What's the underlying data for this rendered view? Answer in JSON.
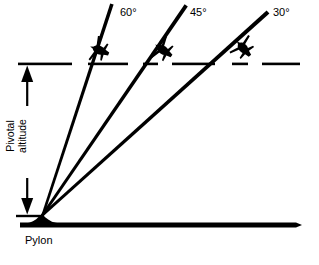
{
  "figure": {
    "type": "diagram",
    "background_color": "#ffffff",
    "ink_color": "#000000"
  },
  "labels": {
    "angle_60": "60°",
    "angle_45": "45°",
    "angle_30": "30°",
    "pylon": "Pylon",
    "pivotal_line_1": "Pivotal",
    "pivotal_line_2": "altitude"
  },
  "diagram_data": {
    "pylon_apex": {
      "x": 42,
      "y": 216
    },
    "ground_line": {
      "x1": 20,
      "y1": 225,
      "x2": 300,
      "y2": 225,
      "width": 4
    },
    "pivotal_altitude_line": {
      "y": 64,
      "x_start": 18,
      "x_end": 300,
      "style": "dashed",
      "segments": [
        {
          "x1": 18,
          "x2": 72
        },
        {
          "x1": 88,
          "x2": 128
        },
        {
          "x1": 143,
          "x2": 158
        },
        {
          "x1": 172,
          "x2": 215
        },
        {
          "x1": 232,
          "x2": 248
        },
        {
          "x1": 262,
          "x2": 300
        }
      ]
    },
    "sight_lines": [
      {
        "angle_label": "60°",
        "angle_deg": 60,
        "x1": 42,
        "y1": 216,
        "x2": 112,
        "y2": 4
      },
      {
        "angle_label": "45°",
        "angle_deg": 45,
        "x1": 42,
        "y1": 216,
        "x2": 186,
        "y2": 6
      },
      {
        "angle_label": "30°",
        "angle_deg": 30,
        "x1": 42,
        "y1": 216,
        "x2": 268,
        "y2": 12
      }
    ],
    "aircraft": [
      {
        "angle_label": "60°",
        "x": 99,
        "y": 50,
        "rotation_deg": -68
      },
      {
        "angle_label": "45°",
        "x": 163,
        "y": 50,
        "rotation_deg": -55
      },
      {
        "angle_label": "30°",
        "x": 243,
        "y": 48,
        "rotation_deg": -42
      }
    ],
    "dimension_arrows": [
      {
        "name": "upper-arrow-up",
        "x": 27,
        "y_tail": 105,
        "y_head": 66,
        "direction": "up"
      },
      {
        "name": "lower-arrow-down",
        "x": 27,
        "y_tail": 180,
        "y_head": 214,
        "direction": "down"
      }
    ],
    "tick_marks": [
      {
        "name": "top-tick",
        "x1": 18,
        "x2": 40,
        "y": 64
      },
      {
        "name": "bottom-tick",
        "x1": 16,
        "x2": 44,
        "y": 216
      }
    ]
  }
}
